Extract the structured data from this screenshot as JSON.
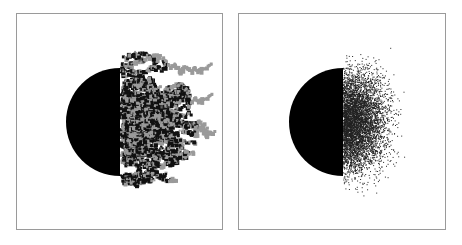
{
  "figure": {
    "panels": [
      {
        "id": "left",
        "description": "Half disk with fractal aggregate cluster growing to the right (black and gray clusters)",
        "frame": {
          "x": 16,
          "y": 13,
          "w": 207,
          "h": 217
        },
        "disk": {
          "cx": 120,
          "cy": 122,
          "r": 54
        },
        "colors": {
          "disk": "#000000",
          "cluster_dark": "#111111",
          "cluster_gray": "#9a9a9a",
          "frame": "#9a9a9a"
        }
      },
      {
        "id": "right",
        "description": "Half disk with diffuse random particle scatter to the right",
        "frame": {
          "x": 238,
          "y": 13,
          "w": 208,
          "h": 217
        },
        "disk": {
          "cx": 343,
          "cy": 122,
          "r": 54
        },
        "colors": {
          "disk": "#000000",
          "dots": "#222222",
          "frame": "#9a9a9a"
        }
      }
    ]
  }
}
